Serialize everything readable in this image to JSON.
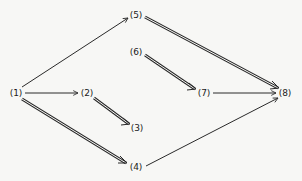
{
  "diagram": {
    "nodes": [
      {
        "id": "1",
        "label": "(1)",
        "x": 16,
        "y": 93
      },
      {
        "id": "2",
        "label": "(2)",
        "x": 87,
        "y": 93
      },
      {
        "id": "3",
        "label": "(3)",
        "x": 137,
        "y": 128
      },
      {
        "id": "4",
        "label": "(4)",
        "x": 136,
        "y": 167
      },
      {
        "id": "5",
        "label": "(5)",
        "x": 136,
        "y": 15
      },
      {
        "id": "6",
        "label": "(6)",
        "x": 136,
        "y": 52
      },
      {
        "id": "7",
        "label": "(7)",
        "x": 204,
        "y": 93
      },
      {
        "id": "8",
        "label": "(8)",
        "x": 285,
        "y": 93
      }
    ],
    "edges": [
      {
        "from": "1",
        "to": "5",
        "style": "single"
      },
      {
        "from": "1",
        "to": "2",
        "style": "single"
      },
      {
        "from": "1",
        "to": "4",
        "style": "double"
      },
      {
        "from": "2",
        "to": "3",
        "style": "double"
      },
      {
        "from": "5",
        "to": "8",
        "style": "double"
      },
      {
        "from": "6",
        "to": "7",
        "style": "double"
      },
      {
        "from": "7",
        "to": "8",
        "style": "single"
      },
      {
        "from": "4",
        "to": "8",
        "style": "single"
      }
    ],
    "colors": {
      "line": "#2a2a2a",
      "background": "#f7f7f5"
    }
  }
}
